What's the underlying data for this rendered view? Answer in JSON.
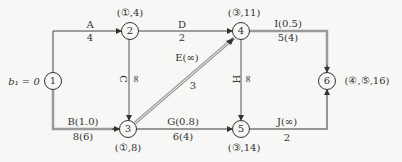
{
  "diagram": {
    "type": "network-flow-graph",
    "source_label": "b₁ = 0",
    "nodes": [
      {
        "id": "1",
        "label": "1",
        "mark": ""
      },
      {
        "id": "2",
        "label": "2",
        "mark": "(①,4)"
      },
      {
        "id": "3",
        "label": "3",
        "mark": "(①,8)"
      },
      {
        "id": "4",
        "label": "4",
        "mark": "(③,11)"
      },
      {
        "id": "5",
        "label": "5",
        "mark": "(③,14)"
      },
      {
        "id": "6",
        "label": "6",
        "mark": "(④,⑤,16)"
      }
    ],
    "edges": [
      {
        "id": "A",
        "from": "1",
        "to": "2",
        "name": "A",
        "value": "4",
        "thick": false
      },
      {
        "id": "B",
        "from": "1",
        "to": "3",
        "name": "B(1.0)",
        "value": "8(6)",
        "thick": true
      },
      {
        "id": "C",
        "from": "2",
        "to": "3",
        "name": "C",
        "value": "∞",
        "thick": false
      },
      {
        "id": "D",
        "from": "2",
        "to": "4",
        "name": "D",
        "value": "2",
        "thick": false
      },
      {
        "id": "E",
        "from": "3",
        "to": "4",
        "name": "E(∞)",
        "value": "3",
        "thick": true
      },
      {
        "id": "G",
        "from": "3",
        "to": "5",
        "name": "G(0.8)",
        "value": "6(4)",
        "thick": false
      },
      {
        "id": "H",
        "from": "4",
        "to": "5",
        "name": "H",
        "value": "∞",
        "thick": false
      },
      {
        "id": "I",
        "from": "4",
        "to": "6",
        "name": "I(0.5)",
        "value": "5(4)",
        "thick": true
      },
      {
        "id": "J",
        "from": "5",
        "to": "6",
        "name": "J(∞)",
        "value": "2",
        "thick": false
      }
    ]
  },
  "colors": {
    "background": "#f7f7f5",
    "line": "#444444",
    "thick_line": "#9a9a9a",
    "text": "#333333"
  }
}
